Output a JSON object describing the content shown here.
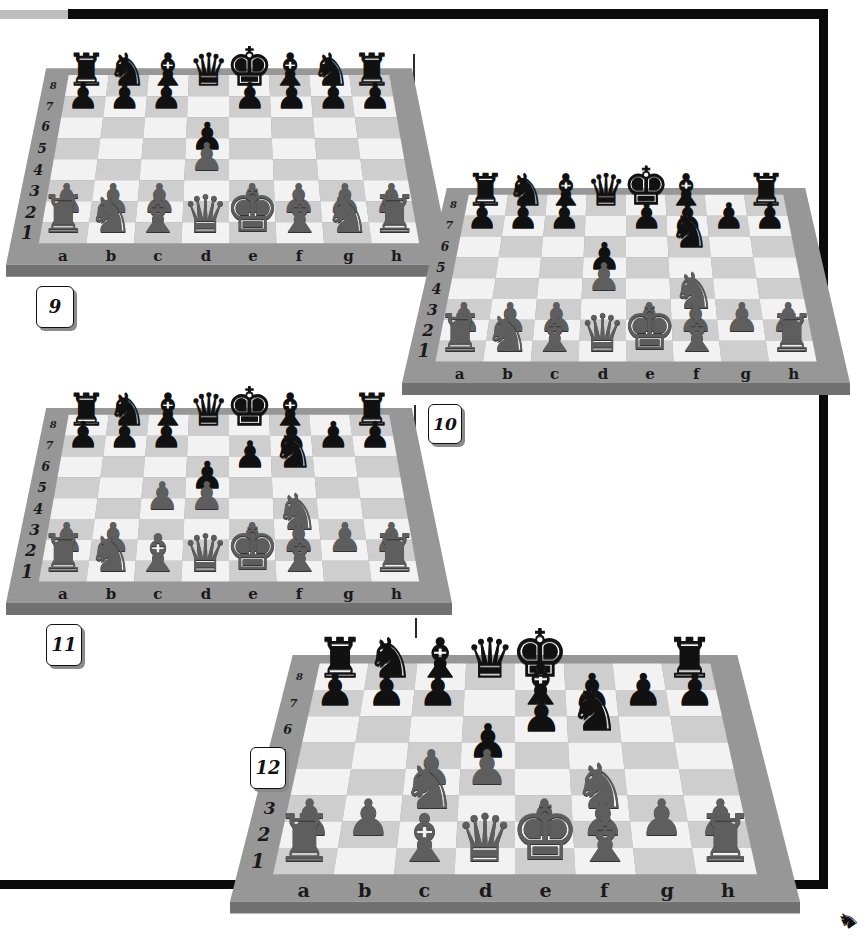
{
  "page": {
    "colors": {
      "frame_line": "#0b0b0b",
      "board_frame": "#949494",
      "light_square": "#f1f1f1",
      "dark_square": "#cfcfcf",
      "black_piece": "#111111",
      "white_piece": "#5e5e5e"
    }
  },
  "files": [
    "a",
    "b",
    "c",
    "d",
    "e",
    "f",
    "g",
    "h"
  ],
  "ranks": [
    "8",
    "7",
    "6",
    "5",
    "4",
    "3",
    "2",
    "1"
  ],
  "glyphs": {
    "K": "♚",
    "Q": "♛",
    "R": "♜",
    "B": "♝",
    "N": "♞",
    "P": "♟",
    "k": "♚",
    "q": "♛",
    "r": "♜",
    "b": "♝",
    "n": "♞",
    "p": "♟"
  },
  "diagrams": [
    {
      "number": "9",
      "position": [
        "rnbqkbnr",
        "ppp.pppp",
        "........",
        "...p....",
        "...P....",
        "........",
        "PPP.PPPP",
        "RNBQKBNR"
      ]
    },
    {
      "number": "10",
      "position": [
        "rnbqkb.r",
        "ppp.pppp",
        ".....n..",
        "...p....",
        "...P....",
        ".....N..",
        "PPP.PPPP",
        "RNBQKB.R"
      ]
    },
    {
      "number": "11",
      "position": [
        "rnbqkb.r",
        "ppp..ppp",
        "....pn..",
        "...p....",
        "..PP....",
        ".....N..",
        "PP..PPPP",
        "RNBQKB.R"
      ]
    },
    {
      "number": "12",
      "position": [
        "rnbqk..r",
        "ppp.bppp",
        "....pn..",
        "...p....",
        "..PP....",
        "..N..N..",
        "PP..PPPP",
        "R.BQKB.R"
      ]
    }
  ]
}
